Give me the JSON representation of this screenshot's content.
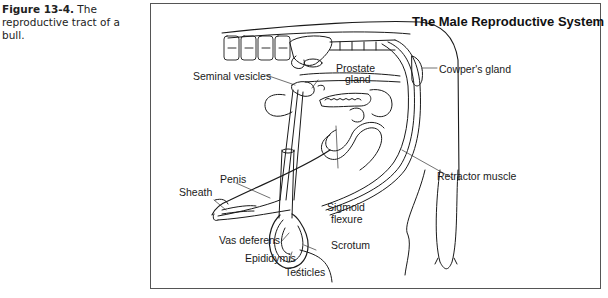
{
  "caption": {
    "figure_label": "Figure 13-4.",
    "text": "The reproductive tract of a bull."
  },
  "diagram": {
    "title": "The Male Reproductive System",
    "labels": {
      "seminal_vesicles": "Seminal vesicles",
      "prostate": "Prostate",
      "prostate_gland": "gland",
      "cowpers_gland": "Cowper's gland",
      "retractor_muscle": "Retractor muscle",
      "penis": "Penis",
      "sheath": "Sheath",
      "sigmoid": "Sigmoid",
      "flexure": "flexure",
      "vas_deferens": "Vas deferens",
      "scrotum": "Scrotum",
      "epididymis": "Epididymis",
      "testicles": "Testicles"
    }
  }
}
